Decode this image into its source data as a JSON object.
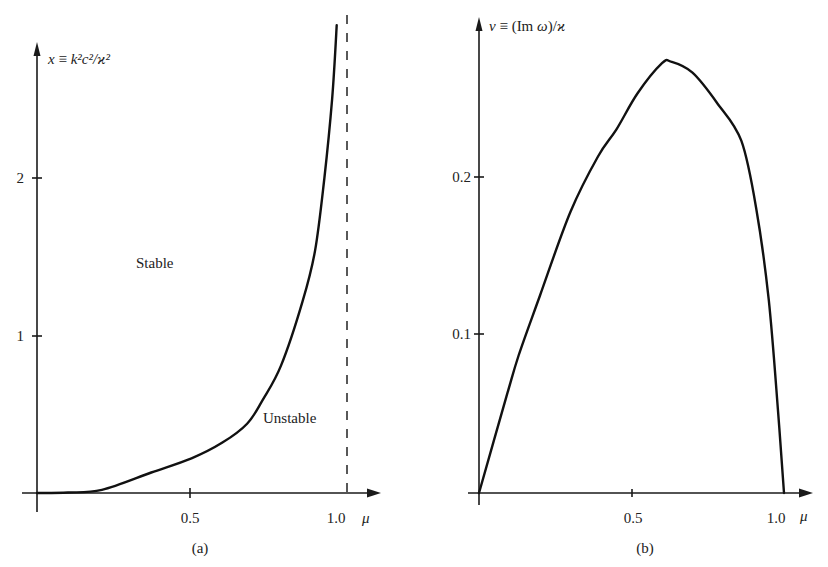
{
  "chart_data": [
    {
      "panel": "a",
      "type": "line",
      "caption": "(a)",
      "xlabel": "μ",
      "ylabel": "x ≡ k²c²/ϰ²",
      "xlim": [
        0,
        1.1
      ],
      "ylim": [
        0,
        2.9
      ],
      "xticks": [
        0.5,
        1.0
      ],
      "xtick_labels": [
        "0.5",
        "1.0"
      ],
      "yticks": [
        1,
        2
      ],
      "ytick_labels": [
        "1",
        "2"
      ],
      "grid": false,
      "legend": null,
      "annotations": [
        {
          "text": "Stable",
          "x": 0.37,
          "y": 1.45
        },
        {
          "text": "Unstable",
          "x": 0.83,
          "y": 0.45
        }
      ],
      "asymptote": {
        "x": 1.0,
        "style": "dashed"
      },
      "series": [
        {
          "name": "stability boundary",
          "x": [
            0.0,
            0.1,
            0.21,
            0.37,
            0.5,
            0.6,
            0.68,
            0.73,
            0.79,
            0.86,
            0.9,
            0.93,
            0.955,
            0.97
          ],
          "y": [
            0.0,
            0.003,
            0.02,
            0.13,
            0.22,
            0.32,
            0.44,
            0.59,
            0.81,
            1.22,
            1.54,
            2.0,
            2.5,
            2.97
          ]
        }
      ]
    },
    {
      "panel": "b",
      "type": "line",
      "caption": "(b)",
      "xlabel": "μ",
      "ylabel": "ν ≡ (Im ω)/ϰ",
      "xlim": [
        0,
        1.1
      ],
      "ylim": [
        0,
        0.3
      ],
      "xticks": [
        0.5,
        1.0
      ],
      "xtick_labels": [
        "0.5",
        "1.0"
      ],
      "yticks": [
        0.1,
        0.2
      ],
      "ytick_labels": [
        "0.1",
        "0.2"
      ],
      "grid": false,
      "legend": null,
      "series": [
        {
          "name": "growth rate",
          "x": [
            0.0,
            0.09,
            0.13,
            0.2,
            0.3,
            0.39,
            0.45,
            0.52,
            0.6,
            0.63,
            0.7,
            0.78,
            0.86,
            0.91,
            0.95,
            0.98,
            1.0
          ],
          "y": [
            0.0,
            0.061,
            0.087,
            0.125,
            0.178,
            0.213,
            0.23,
            0.253,
            0.272,
            0.273,
            0.266,
            0.247,
            0.223,
            0.179,
            0.122,
            0.053,
            0.0
          ]
        }
      ]
    }
  ],
  "labels": {
    "a": {
      "ylabel_var": "x",
      "ylabel_eq": " ≡ ",
      "ylabel_expr": "k²c²/ϰ²",
      "xlabel": "μ",
      "caption": "(a)",
      "stable": "Stable",
      "unstable": "Unstable",
      "xtick_0": "0.5",
      "xtick_1": "1.0",
      "ytick_0": "1",
      "ytick_1": "2"
    },
    "b": {
      "ylabel_var": "ν",
      "ylabel_rest": " ≡ (Im ",
      "ylabel_omega": "ω",
      "ylabel_tail": ")/",
      "ylabel_kappa": "ϰ",
      "xlabel": "μ",
      "caption": "(b)",
      "xtick_0": "0.5",
      "xtick_1": "1.0",
      "ytick_0": "0.1",
      "ytick_1": "0.2"
    }
  }
}
